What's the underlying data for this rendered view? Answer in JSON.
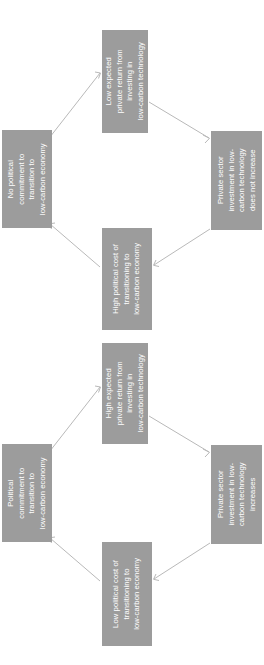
{
  "diagram": {
    "type": "two-vicious-and-virtuous-cycle-flow-diagrams",
    "orientation": "page-rotated-90-ccw",
    "box_fill_color": "#9c9c9c",
    "box_text_color": "#ffffff",
    "arrow_color": "#b9b9b9",
    "background_color": "#ffffff",
    "cycles": [
      {
        "id": "cycle-1",
        "name": "vicious-cycle",
        "nodes": [
          {
            "id": "c1-west",
            "position": "west",
            "text": "No political commitment to transition to low-carbon economy",
            "lines": [
              "No political",
              "commitment to",
              "transition to",
              "low-carbon economy"
            ]
          },
          {
            "id": "c1-north",
            "position": "north",
            "text": "Low expected private return from investing in low-carbon technology",
            "lines": [
              "Low expected",
              "private return from",
              "investing in",
              "low-carbon technology"
            ]
          },
          {
            "id": "c1-east",
            "position": "east",
            "text": "Private sector investment in low-carbon technology does not increase",
            "lines": [
              "Private sector",
              "investment in low-",
              "carbon technology",
              "does not increase"
            ]
          },
          {
            "id": "c1-south",
            "position": "south",
            "text": "High political cost of transitioning to low-carbon economy",
            "lines": [
              "High political cost of",
              "transitioning to",
              "low-carbon economy"
            ]
          }
        ],
        "edges": [
          {
            "from": "c1-west",
            "to": "c1-north"
          },
          {
            "from": "c1-north",
            "to": "c1-east"
          },
          {
            "from": "c1-east",
            "to": "c1-south"
          },
          {
            "from": "c1-south",
            "to": "c1-west"
          }
        ]
      },
      {
        "id": "cycle-2",
        "name": "virtuous-cycle",
        "nodes": [
          {
            "id": "c2-west",
            "position": "west",
            "text": "Political commitment to transition to low-carbon economy",
            "lines": [
              "Political",
              "commitment to",
              "transition to",
              "low-carbon economy"
            ]
          },
          {
            "id": "c2-north",
            "position": "north",
            "text": "High expected private return from investing in low-carbon technology",
            "lines": [
              "High expected",
              "private return from",
              "investing in",
              "low-carbon technology"
            ]
          },
          {
            "id": "c2-east",
            "position": "east",
            "text": "Private sector investment in low-carbon technology increases",
            "lines": [
              "Private sector",
              "investment in low-",
              "carbon technology",
              "increases"
            ]
          },
          {
            "id": "c2-south",
            "position": "south",
            "text": "Low political cost of transitioning to low-carbon economy",
            "lines": [
              "Low political cost of",
              "transitioning to",
              "low-carbon economy"
            ]
          }
        ],
        "edges": [
          {
            "from": "c2-west",
            "to": "c2-north"
          },
          {
            "from": "c2-north",
            "to": "c2-east"
          },
          {
            "from": "c2-east",
            "to": "c2-south"
          },
          {
            "from": "c2-south",
            "to": "c2-west"
          }
        ]
      }
    ]
  }
}
